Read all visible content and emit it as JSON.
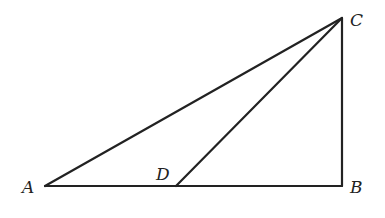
{
  "diagram": {
    "type": "geometry-triangle",
    "points": {
      "A": {
        "label": "A",
        "x": 45,
        "y": 186
      },
      "B": {
        "label": "B",
        "x": 342,
        "y": 186
      },
      "C": {
        "label": "C",
        "x": 342,
        "y": 18
      },
      "D": {
        "label": "D",
        "x": 176,
        "y": 186
      }
    },
    "segments": [
      "AB",
      "BC",
      "CA",
      "CD"
    ],
    "line_color": "#222222"
  }
}
